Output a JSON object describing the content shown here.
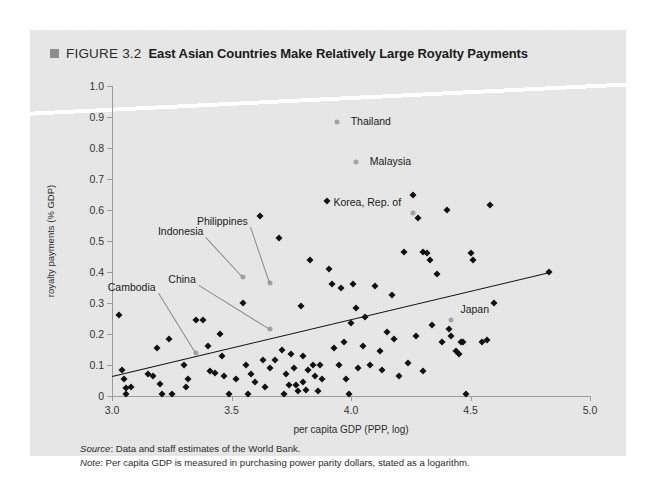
{
  "figure": {
    "marker_icon": "gray-square-bullet",
    "number": "FIGURE 3.2",
    "title": "East Asian Countries Make Relatively Large Royalty Payments"
  },
  "notes": {
    "source_label": "Source",
    "source_text": ": Data and staff estimates of the World Bank.",
    "note_label": "Note",
    "note_text": ": Per capita GDP is measured in purchasing power parity dollars, stated as a logarithm."
  },
  "colors": {
    "panel": "#e8e8e8",
    "marker": "#111111",
    "highlight_marker": "#a2a2a2",
    "trend_line": "#111111",
    "axis": "#9a9a9a",
    "leader_line": "#8a8a8a"
  },
  "chart_data": {
    "type": "scatter",
    "title": "East Asian Countries Make Relatively Large Royalty Payments",
    "xlabel": "per capita GDP (PPP, log)",
    "ylabel": "royalty payments (% GDP)",
    "xlim": [
      3.0,
      5.0
    ],
    "ylim": [
      0,
      1.0
    ],
    "xticks": [
      3.0,
      3.5,
      4.0,
      4.5,
      5.0
    ],
    "xtick_labels": [
      "3.0",
      "3.5",
      "4.0",
      "4.5",
      "5.0"
    ],
    "yticks": [
      0,
      0.1,
      0.2,
      0.3,
      0.4,
      0.5,
      0.6,
      0.7,
      0.8,
      0.9,
      1.0
    ],
    "ytick_labels": [
      "0",
      "0.1",
      "0.2",
      "0.3",
      "0.4",
      "0.5",
      "0.6",
      "0.7",
      "0.8",
      "0.9",
      "1.0"
    ],
    "grid": false,
    "legend": "none",
    "trend_line": {
      "x0": 3.0,
      "y0": 0.065,
      "x1": 4.83,
      "y1": 0.4
    },
    "highlighted": [
      {
        "label": "Thailand",
        "x": 3.94,
        "y": 0.885,
        "label_dx": 14,
        "label_dy": -1,
        "leader": false
      },
      {
        "label": "Malaysia",
        "x": 4.02,
        "y": 0.755,
        "label_dx": 14,
        "label_dy": -1,
        "leader": false
      },
      {
        "label": "Korea, Rep. of",
        "x": 4.26,
        "y": 0.59,
        "label_dx": -12,
        "label_dy": -11,
        "leader": false,
        "anchor": "end"
      },
      {
        "label": "Japan",
        "x": 4.42,
        "y": 0.245,
        "label_dx": 9,
        "label_dy": -11,
        "leader": false
      },
      {
        "label": "Philippines",
        "x": 3.66,
        "y": 0.365,
        "label_dx": -22,
        "label_dy": -62,
        "leader": true,
        "anchor": "end"
      },
      {
        "label": "Indonesia",
        "x": 3.55,
        "y": 0.385,
        "label_dx": -40,
        "label_dy": -46,
        "leader": true,
        "anchor": "end"
      },
      {
        "label": "China",
        "x": 3.66,
        "y": 0.215,
        "label_dx": -74,
        "label_dy": -50,
        "leader": true,
        "anchor": "end"
      },
      {
        "label": "Cambodia",
        "x": 3.35,
        "y": 0.14,
        "label_dx": -40,
        "label_dy": -66,
        "leader": true,
        "anchor": "end"
      }
    ],
    "points": [
      [
        3.03,
        0.26
      ],
      [
        3.04,
        0.085
      ],
      [
        3.05,
        0.055
      ],
      [
        3.06,
        0.025
      ],
      [
        3.06,
        0.005
      ],
      [
        3.08,
        0.03
      ],
      [
        3.15,
        0.07
      ],
      [
        3.17,
        0.065
      ],
      [
        3.19,
        0.155
      ],
      [
        3.2,
        0.04
      ],
      [
        3.21,
        0.005
      ],
      [
        3.25,
        0.005
      ],
      [
        3.24,
        0.185
      ],
      [
        3.3,
        0.1
      ],
      [
        3.31,
        0.03
      ],
      [
        3.32,
        0.055
      ],
      [
        3.35,
        0.245
      ],
      [
        3.38,
        0.245
      ],
      [
        3.4,
        0.16
      ],
      [
        3.41,
        0.08
      ],
      [
        3.43,
        0.075
      ],
      [
        3.45,
        0.2
      ],
      [
        3.46,
        0.13
      ],
      [
        3.47,
        0.065
      ],
      [
        3.49,
        0.005
      ],
      [
        3.52,
        0.055
      ],
      [
        3.55,
        0.3
      ],
      [
        3.56,
        0.1
      ],
      [
        3.57,
        0.005
      ],
      [
        3.58,
        0.07
      ],
      [
        3.6,
        0.045
      ],
      [
        3.62,
        0.58
      ],
      [
        3.63,
        0.115
      ],
      [
        3.64,
        0.03
      ],
      [
        3.66,
        0.09
      ],
      [
        3.68,
        0.115
      ],
      [
        3.7,
        0.51
      ],
      [
        3.71,
        0.15
      ],
      [
        3.72,
        0.005
      ],
      [
        3.73,
        0.07
      ],
      [
        3.74,
        0.035
      ],
      [
        3.75,
        0.135
      ],
      [
        3.76,
        0.09
      ],
      [
        3.77,
        0.035
      ],
      [
        3.78,
        0.015
      ],
      [
        3.79,
        0.29
      ],
      [
        3.8,
        0.13
      ],
      [
        3.8,
        0.045
      ],
      [
        3.81,
        0.02
      ],
      [
        3.82,
        0.085
      ],
      [
        3.83,
        0.44
      ],
      [
        3.84,
        0.1
      ],
      [
        3.85,
        0.065
      ],
      [
        3.86,
        0.015
      ],
      [
        3.87,
        0.1
      ],
      [
        3.88,
        0.055
      ],
      [
        3.9,
        0.63
      ],
      [
        3.91,
        0.41
      ],
      [
        3.92,
        0.36
      ],
      [
        3.93,
        0.155
      ],
      [
        3.95,
        0.1
      ],
      [
        3.96,
        0.35
      ],
      [
        3.97,
        0.175
      ],
      [
        3.98,
        0.055
      ],
      [
        3.99,
        0.005
      ],
      [
        4.0,
        0.235
      ],
      [
        4.01,
        0.36
      ],
      [
        4.02,
        0.285
      ],
      [
        4.03,
        0.09
      ],
      [
        4.05,
        0.16
      ],
      [
        4.06,
        0.255
      ],
      [
        4.08,
        0.1
      ],
      [
        4.1,
        0.355
      ],
      [
        4.12,
        0.145
      ],
      [
        4.13,
        0.085
      ],
      [
        4.15,
        0.205
      ],
      [
        4.17,
        0.325
      ],
      [
        4.18,
        0.185
      ],
      [
        4.2,
        0.065
      ],
      [
        4.22,
        0.465
      ],
      [
        4.24,
        0.105
      ],
      [
        4.26,
        0.65
      ],
      [
        4.27,
        0.195
      ],
      [
        4.28,
        0.575
      ],
      [
        4.3,
        0.465
      ],
      [
        4.32,
        0.46
      ],
      [
        4.33,
        0.44
      ],
      [
        4.34,
        0.23
      ],
      [
        4.36,
        0.395
      ],
      [
        4.38,
        0.175
      ],
      [
        4.4,
        0.6
      ],
      [
        4.41,
        0.215
      ],
      [
        4.42,
        0.195
      ],
      [
        4.44,
        0.145
      ],
      [
        4.45,
        0.135
      ],
      [
        4.46,
        0.175
      ],
      [
        4.47,
        0.175
      ],
      [
        4.48,
        0.005
      ],
      [
        4.5,
        0.46
      ],
      [
        4.51,
        0.44
      ],
      [
        4.3,
        0.08
      ],
      [
        4.55,
        0.175
      ],
      [
        4.57,
        0.18
      ],
      [
        4.58,
        0.615
      ],
      [
        4.6,
        0.3
      ],
      [
        4.83,
        0.4
      ]
    ]
  }
}
